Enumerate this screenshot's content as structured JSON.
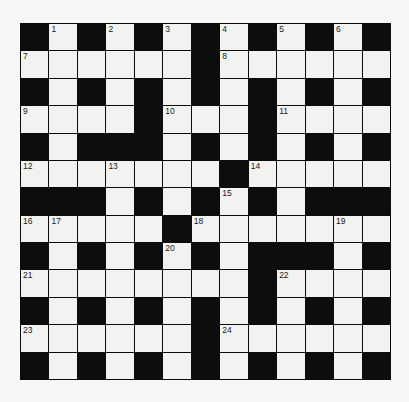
{
  "puzzle": {
    "rows": 13,
    "cols": 13,
    "grid": [
      "#.#.#.#.#.#.#",
      "......#......",
      "#.#.#.#.#.#.#",
      "....#...#....",
      "#.###.#.#.#.#",
      ".......#.....",
      "###.#.#.#.###",
      ".....#.......",
      "#.#.#.#.###.#",
      "........#....",
      "#.#.#.#.#.#.#",
      "......#......",
      "#.#.#.#.#.#.#"
    ],
    "numbers": [
      {
        "n": "1",
        "r": 0,
        "c": 1
      },
      {
        "n": "2",
        "r": 0,
        "c": 3
      },
      {
        "n": "3",
        "r": 0,
        "c": 5
      },
      {
        "n": "4",
        "r": 0,
        "c": 7
      },
      {
        "n": "5",
        "r": 0,
        "c": 9
      },
      {
        "n": "6",
        "r": 0,
        "c": 11
      },
      {
        "n": "7",
        "r": 1,
        "c": 0
      },
      {
        "n": "8",
        "r": 1,
        "c": 7
      },
      {
        "n": "9",
        "r": 3,
        "c": 0
      },
      {
        "n": "10",
        "r": 3,
        "c": 5
      },
      {
        "n": "11",
        "r": 3,
        "c": 9
      },
      {
        "n": "12",
        "r": 5,
        "c": 0
      },
      {
        "n": "13",
        "r": 5,
        "c": 3
      },
      {
        "n": "14",
        "r": 5,
        "c": 8
      },
      {
        "n": "15",
        "r": 6,
        "c": 7
      },
      {
        "n": "16",
        "r": 7,
        "c": 0
      },
      {
        "n": "17",
        "r": 7,
        "c": 1
      },
      {
        "n": "18",
        "r": 7,
        "c": 6
      },
      {
        "n": "19",
        "r": 7,
        "c": 11
      },
      {
        "n": "20",
        "r": 8,
        "c": 5
      },
      {
        "n": "21",
        "r": 9,
        "c": 0
      },
      {
        "n": "22",
        "r": 9,
        "c": 9
      },
      {
        "n": "23",
        "r": 11,
        "c": 0
      },
      {
        "n": "24",
        "r": 11,
        "c": 7
      }
    ]
  },
  "colors": {
    "block": "#0d0d0d",
    "cell": "#f2f2f0",
    "background": "#f7f7f5"
  }
}
